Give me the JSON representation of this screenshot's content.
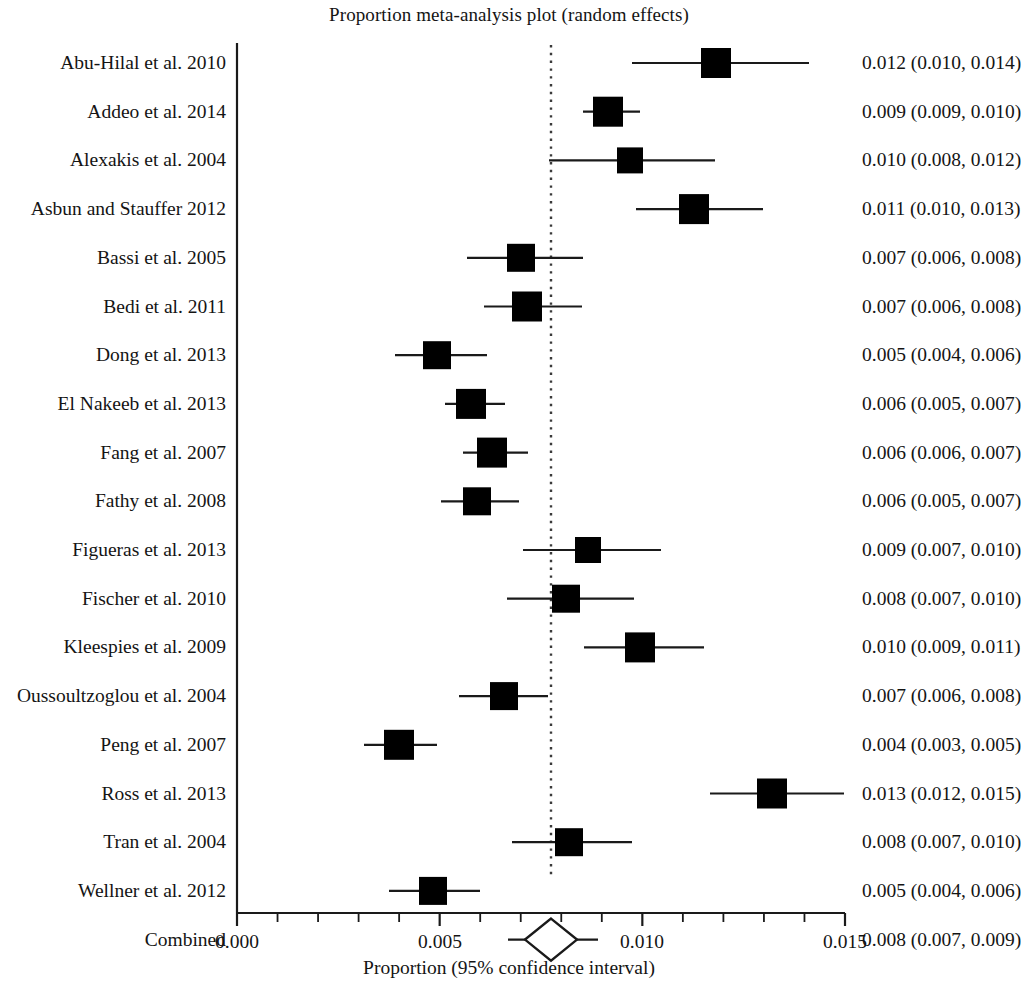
{
  "chart_data": {
    "type": "forest",
    "title": "Proportion meta-analysis plot (random effects)",
    "xlabel": "Proportion (95% confidence interval)",
    "ylabel": "",
    "xlim": [
      0.0,
      0.015
    ],
    "xticks": [
      0.0,
      0.005,
      0.01,
      0.015
    ],
    "xtick_labels": [
      "0.000",
      "0.005",
      "0.010",
      "0.015"
    ],
    "minor_tick_step": 0.001,
    "grid": false,
    "legend": null,
    "reference_line": 0.0078,
    "reference_line_style": "dotted",
    "effect_measure": "Proportion",
    "model": "random effects",
    "marker_shape": "square",
    "summary_shape": "diamond",
    "categories": [
      "Abu-Hilal et al. 2010",
      "Addeo et al. 2014",
      "Alexakis et al. 2004",
      "Asbun and Stauffer 2012",
      "Bassi et al. 2005",
      "Bedi et al. 2011",
      "Dong et al. 2013",
      "El Nakeeb et al. 2013",
      "Fang et al. 2007",
      "Fathy et al. 2008",
      "Figueras et al. 2013",
      "Fischer et al. 2010",
      "Kleespies et al. 2009",
      "Oussoultzoglou et al. 2004",
      "Peng et al. 2007",
      "Ross et al. 2013",
      "Tran et al. 2004",
      "Wellner et al. 2012",
      "Combined"
    ],
    "values": [
      0.012,
      0.009,
      0.01,
      0.011,
      0.007,
      0.007,
      0.005,
      0.006,
      0.006,
      0.006,
      0.009,
      0.008,
      0.01,
      0.007,
      0.004,
      0.013,
      0.008,
      0.005,
      0.008
    ],
    "ci_lower": [
      0.01,
      0.009,
      0.008,
      0.01,
      0.006,
      0.006,
      0.004,
      0.005,
      0.006,
      0.005,
      0.007,
      0.007,
      0.009,
      0.006,
      0.003,
      0.012,
      0.007,
      0.004,
      0.007
    ],
    "ci_upper": [
      0.014,
      0.01,
      0.012,
      0.013,
      0.008,
      0.008,
      0.006,
      0.007,
      0.007,
      0.007,
      0.01,
      0.01,
      0.011,
      0.008,
      0.005,
      0.015,
      0.01,
      0.006,
      0.009
    ],
    "rows": [
      {
        "study": "Abu-Hilal et al. 2010",
        "estimate": 0.012,
        "low": 0.01,
        "high": 0.014,
        "stat": "0.012 (0.010, 0.014)",
        "summary": false,
        "px_center": 716,
        "px_low": 632,
        "px_high": 809,
        "px_size": 30
      },
      {
        "study": "Addeo et al. 2014",
        "estimate": 0.009,
        "low": 0.009,
        "high": 0.01,
        "stat": "0.009 (0.009, 0.010)",
        "summary": false,
        "px_center": 608,
        "px_low": 583,
        "px_high": 640,
        "px_size": 30
      },
      {
        "study": "Alexakis et al. 2004",
        "estimate": 0.01,
        "low": 0.008,
        "high": 0.012,
        "stat": "0.010 (0.008, 0.012)",
        "summary": false,
        "px_center": 630,
        "px_low": 549,
        "px_high": 715,
        "px_size": 26
      },
      {
        "study": "Asbun and Stauffer 2012",
        "estimate": 0.011,
        "low": 0.01,
        "high": 0.013,
        "stat": "0.011 (0.010, 0.013)",
        "summary": false,
        "px_center": 694,
        "px_low": 636,
        "px_high": 763,
        "px_size": 30
      },
      {
        "study": "Bassi et al. 2005",
        "estimate": 0.007,
        "low": 0.006,
        "high": 0.008,
        "stat": "0.007 (0.006, 0.008)",
        "summary": false,
        "px_center": 521,
        "px_low": 467,
        "px_high": 583,
        "px_size": 28
      },
      {
        "study": "Bedi et al. 2011",
        "estimate": 0.007,
        "low": 0.006,
        "high": 0.008,
        "stat": "0.007 (0.006, 0.008)",
        "summary": false,
        "px_center": 527,
        "px_low": 484,
        "px_high": 582,
        "px_size": 30
      },
      {
        "study": "Dong et al. 2013",
        "estimate": 0.005,
        "low": 0.004,
        "high": 0.006,
        "stat": "0.005 (0.004, 0.006)",
        "summary": false,
        "px_center": 437,
        "px_low": 395,
        "px_high": 487,
        "px_size": 28
      },
      {
        "study": "El Nakeeb et al. 2013",
        "estimate": 0.006,
        "low": 0.005,
        "high": 0.007,
        "stat": "0.006 (0.005, 0.007)",
        "summary": false,
        "px_center": 471,
        "px_low": 445,
        "px_high": 505,
        "px_size": 30
      },
      {
        "study": "Fang et al. 2007",
        "estimate": 0.006,
        "low": 0.006,
        "high": 0.007,
        "stat": "0.006 (0.006, 0.007)",
        "summary": false,
        "px_center": 492,
        "px_low": 463,
        "px_high": 528,
        "px_size": 30
      },
      {
        "study": "Fathy et al. 2008",
        "estimate": 0.006,
        "low": 0.005,
        "high": 0.007,
        "stat": "0.006 (0.005, 0.007)",
        "summary": false,
        "px_center": 477,
        "px_low": 441,
        "px_high": 519,
        "px_size": 28
      },
      {
        "study": "Figueras et al. 2013",
        "estimate": 0.009,
        "low": 0.007,
        "high": 0.01,
        "stat": "0.009 (0.007, 0.010)",
        "summary": false,
        "px_center": 588,
        "px_low": 523,
        "px_high": 661,
        "px_size": 26
      },
      {
        "study": "Fischer et al. 2010",
        "estimate": 0.008,
        "low": 0.007,
        "high": 0.01,
        "stat": "0.008 (0.007, 0.010)",
        "summary": false,
        "px_center": 566,
        "px_low": 507,
        "px_high": 634,
        "px_size": 28
      },
      {
        "study": "Kleespies et al. 2009",
        "estimate": 0.01,
        "low": 0.009,
        "high": 0.011,
        "stat": "0.010 (0.009, 0.011)",
        "summary": false,
        "px_center": 640,
        "px_low": 584,
        "px_high": 704,
        "px_size": 30
      },
      {
        "study": "Oussoultzoglou et al. 2004",
        "estimate": 0.007,
        "low": 0.006,
        "high": 0.008,
        "stat": "0.007 (0.006, 0.008)",
        "summary": false,
        "px_center": 504,
        "px_low": 459,
        "px_high": 548,
        "px_size": 28
      },
      {
        "study": "Peng et al. 2007",
        "estimate": 0.004,
        "low": 0.003,
        "high": 0.005,
        "stat": "0.004 (0.003, 0.005)",
        "summary": false,
        "px_center": 399,
        "px_low": 364,
        "px_high": 437,
        "px_size": 30
      },
      {
        "study": "Ross et al. 2013",
        "estimate": 0.013,
        "low": 0.012,
        "high": 0.015,
        "stat": "0.013 (0.012, 0.015)",
        "summary": false,
        "px_center": 772,
        "px_low": 710,
        "px_high": 844,
        "px_size": 30
      },
      {
        "study": "Tran et al. 2004",
        "estimate": 0.008,
        "low": 0.007,
        "high": 0.01,
        "stat": "0.008 (0.007, 0.010)",
        "summary": false,
        "px_center": 569,
        "px_low": 512,
        "px_high": 632,
        "px_size": 28
      },
      {
        "study": "Wellner et al. 2012",
        "estimate": 0.005,
        "low": 0.004,
        "high": 0.006,
        "stat": "0.005 (0.004, 0.006)",
        "summary": false,
        "px_center": 433,
        "px_low": 389,
        "px_high": 480,
        "px_size": 28
      },
      {
        "study": "Combined",
        "estimate": 0.008,
        "low": 0.007,
        "high": 0.009,
        "stat": "0.008 (0.007, 0.009)",
        "summary": true,
        "px_center": 551,
        "px_low": 508,
        "px_high": 598,
        "px_size": 26
      }
    ]
  },
  "style": {
    "marker_color": "#000000",
    "line_color": "#1a1a1a",
    "axis_color": "#1a1a1a",
    "reference_color": "#3a3a3a",
    "background": "#ffffff",
    "summary_fill": "#ffffff"
  },
  "geometry": {
    "axis_x0_px": 237,
    "axis_x1_px": 845,
    "axis_y_px": 913,
    "first_row_y_px": 63,
    "row_spacing_px": 48.7,
    "vline_x_px": 237,
    "vline_y_top_px": 43,
    "vline_y_bottom_px": 913,
    "ref_line_x_px": 551,
    "ref_line_y_top_px": 45,
    "ref_line_y_bottom_px": 878
  },
  "axis": {
    "tick_labels": [
      "0.000",
      "0.005",
      "0.010",
      "0.015"
    ],
    "tick_px": [
      237,
      440,
      642,
      845
    ],
    "title": "Proportion (95% confidence interval)"
  }
}
